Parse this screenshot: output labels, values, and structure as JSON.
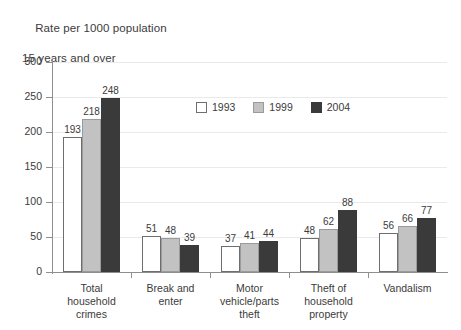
{
  "chart_data": {
    "type": "bar",
    "title": "Rate per 1000 population",
    "subtitle": "15 years and over",
    "xlabel": "",
    "ylabel": "",
    "ylim": [
      0,
      300
    ],
    "yticks": [
      0,
      50,
      100,
      150,
      200,
      250,
      300
    ],
    "ytick_labels": [
      "0",
      "50",
      "100",
      "150",
      "200",
      "250",
      "300"
    ],
    "grid": true,
    "legend_position": "inside-top-center",
    "categories": [
      "Total household crimes",
      "Break and enter",
      "Motor vehicle/parts theft",
      "Theft of household property",
      "Vandalism"
    ],
    "category_lines": [
      [
        "Total",
        "household",
        "crimes"
      ],
      [
        "Break and",
        "enter"
      ],
      [
        "Motor",
        "vehicle/parts",
        "theft"
      ],
      [
        "Theft of",
        "household",
        "property"
      ],
      [
        "Vandalism"
      ]
    ],
    "series": [
      {
        "name": "1993",
        "color": "#ffffff",
        "values": [
          193,
          51,
          37,
          48,
          56
        ]
      },
      {
        "name": "1999",
        "color": "#c2c2c2",
        "values": [
          218,
          48,
          41,
          62,
          66
        ]
      },
      {
        "name": "2004",
        "color": "#3a3a3a",
        "values": [
          248,
          39,
          44,
          88,
          77
        ]
      }
    ]
  },
  "colors": {
    "axis": "#8f8f8f",
    "grid": "#eaeaea",
    "text": "#3b3b3b",
    "series_1993": "#ffffff",
    "series_1999": "#c2c2c2",
    "series_2004": "#3a3a3a",
    "background": "#ffffff"
  }
}
